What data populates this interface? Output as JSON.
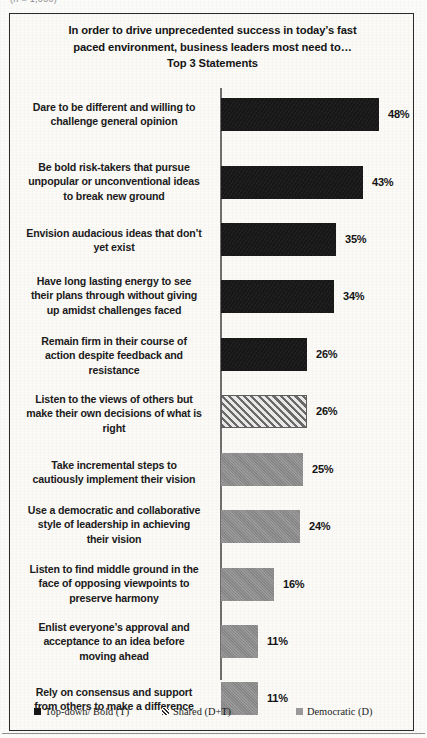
{
  "scan": {
    "clipped_top_text": "(n = 1,000)"
  },
  "chart_title_line1": "In order to drive unprecedented success in today’s fast",
  "chart_title_line2": "paced environment, business leaders most need to…",
  "chart_title_line3": "Top 3 Statements",
  "legend": {
    "items": [
      {
        "label": "Top-down/ Bold (T)",
        "swatch": "solid-black-square-icon",
        "color": "#161616"
      },
      {
        "label": "Shared (D+T)",
        "swatch": "hatched-square-icon",
        "color": "#8e8e8e"
      },
      {
        "label": "Democratic (D)",
        "swatch": "gray-square-icon",
        "color": "#9a9a9a"
      }
    ]
  },
  "chart_data": {
    "type": "bar",
    "orientation": "horizontal",
    "title": "In order to drive unprecedented success in today’s fast paced environment, business leaders most need to… Top 3 Statements",
    "xlabel": "",
    "ylabel": "",
    "xlim": [
      0,
      60
    ],
    "grid": false,
    "legend_position": "bottom",
    "value_suffix": "%",
    "categories": [
      "Dare to be different and willing to challenge  general opinion",
      "Be bold risk-takers  that pursue unpopular or unconventional ideas to break new ground",
      "Envision audacious ideas that don’t yet exist",
      "Have long lasting energy to see their plans through without giving up amidst challenges faced",
      "Remain firm in their course of action despite feedback and resistance",
      "Listen to the views of others but make their own decisions of what is right",
      "Take incremental steps to cautiously implement their vision",
      "Use a democratic and collaborative style of leadership  in achieving their vision",
      "Listen to find middle ground in the face of opposing viewpoints  to preserve harmony",
      "Enlist everyone’s approval and acceptance to an idea before moving ahead",
      "Rely on consensus and support from others to make a difference"
    ],
    "values": [
      48,
      43,
      35,
      34,
      26,
      26,
      25,
      24,
      16,
      11,
      11
    ],
    "value_labels": [
      "48%",
      "43%",
      "35%",
      "34%",
      "26%",
      "26%",
      "25%",
      "24%",
      "16%",
      "11%",
      "11%"
    ],
    "series_of_bar": [
      "Top-down/ Bold (T)",
      "Top-down/ Bold (T)",
      "Top-down/ Bold (T)",
      "Top-down/ Bold (T)",
      "Top-down/ Bold (T)",
      "Shared (D+T)",
      "Democratic (D)",
      "Democratic (D)",
      "Democratic (D)",
      "Democratic (D)",
      "Democratic (D)"
    ]
  },
  "rows": [
    {
      "label_lines": [
        "Dare to be different and willing to",
        "challenge  general opinion"
      ],
      "value": "48%",
      "style": "topdown",
      "bar_px": 158,
      "top": 12,
      "bar_top": 10,
      "bar_h": 33,
      "label_top": 12
    },
    {
      "label_lines": [
        "Be bold risk-takers  that pursue",
        "unpopular or unconventional ideas",
        "to break new ground"
      ],
      "value": "43%",
      "style": "topdown",
      "bar_px": 142,
      "top": 72,
      "bar_top": 78,
      "bar_h": 33,
      "label_top": 72
    },
    {
      "label_lines": [
        "Envision audacious ideas that don’t",
        "yet exist"
      ],
      "value": "35%",
      "style": "topdown",
      "bar_px": 115,
      "top": 138,
      "bar_top": 135,
      "bar_h": 33,
      "label_top": 138
    },
    {
      "label_lines": [
        "Have long lasting energy to see",
        "their plans through without giving",
        "up amidst challenges faced"
      ],
      "value": "34%",
      "style": "topdown",
      "bar_px": 113,
      "top": 186,
      "bar_top": 192,
      "bar_h": 33,
      "label_top": 186
    },
    {
      "label_lines": [
        "Remain firm in their course of",
        "action despite feedback and",
        "resistance"
      ],
      "value": "26%",
      "style": "topdown",
      "bar_px": 86,
      "top": 246,
      "bar_top": 250,
      "bar_h": 33,
      "label_top": 246
    },
    {
      "label_lines": [
        "Listen to the views of others but",
        "make their own decisions of what is",
        "right"
      ],
      "value": "26%",
      "style": "shared",
      "bar_px": 86,
      "top": 304,
      "bar_top": 307,
      "bar_h": 33,
      "label_top": 304
    },
    {
      "label_lines": [
        "Take incremental steps to",
        "cautiously implement their vision"
      ],
      "value": "25%",
      "style": "democratic",
      "bar_px": 82,
      "top": 370,
      "bar_top": 365,
      "bar_h": 33,
      "label_top": 370
    },
    {
      "label_lines": [
        "Use a democratic and collaborative",
        "style of leadership  in achieving",
        "their vision"
      ],
      "value": "24%",
      "style": "democratic",
      "bar_px": 79,
      "top": 415,
      "bar_top": 422,
      "bar_h": 33,
      "label_top": 415
    },
    {
      "label_lines": [
        "Listen to find middle ground in the",
        "face of opposing viewpoints  to",
        "preserve harmony"
      ],
      "value": "16%",
      "style": "democratic",
      "bar_px": 53,
      "top": 474,
      "bar_top": 480,
      "bar_h": 33,
      "label_top": 474
    },
    {
      "label_lines": [
        "Enlist everyone’s approval and",
        "acceptance to an idea before",
        "moving ahead"
      ],
      "value": "11%",
      "style": "democratic",
      "bar_px": 37,
      "top": 532,
      "bar_top": 537,
      "bar_h": 33,
      "label_top": 532
    },
    {
      "label_lines": [
        "Rely on consensus and support",
        "from others to make a difference"
      ],
      "value": "11%",
      "style": "democratic",
      "bar_px": 37,
      "top": 597,
      "bar_top": 594,
      "bar_h": 33,
      "label_top": 597
    }
  ]
}
